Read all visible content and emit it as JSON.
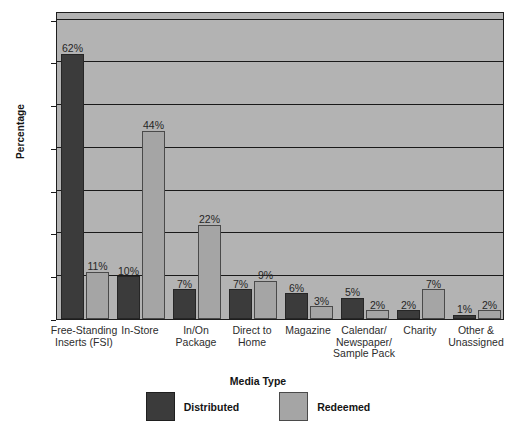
{
  "chart_data": {
    "type": "bar",
    "title": "",
    "xlabel": "Media Type",
    "ylabel": "Percentage",
    "ylim": [
      0,
      72
    ],
    "yticks": [
      0,
      10,
      20,
      30,
      40,
      50,
      60,
      70
    ],
    "ytick_labels": [
      "0",
      "10",
      "20",
      "30",
      "40",
      "50",
      "60",
      "70"
    ],
    "grid": true,
    "legend_position": "bottom",
    "value_suffix": "%",
    "categories": [
      "Free-Standing Inserts (FSI)",
      "In-Store",
      "In/On Package",
      "Direct to Home",
      "Magazine",
      "Calendar/ Newspaper/ Sample Pack",
      "Charity",
      "Other & Unassigned"
    ],
    "category_lines": [
      [
        "Free-Standing",
        "Inserts (FSI)"
      ],
      [
        "In-Store"
      ],
      [
        "In/On",
        "Package"
      ],
      [
        "Direct to",
        "Home"
      ],
      [
        "Magazine"
      ],
      [
        "Calendar/",
        "Newspaper/",
        "Sample Pack"
      ],
      [
        "Charity"
      ],
      [
        "Other &",
        "Unassigned"
      ]
    ],
    "series": [
      {
        "name": "Distributed",
        "color": "#3b3b3b",
        "values": [
          62,
          10,
          7,
          7,
          6,
          5,
          2,
          1
        ],
        "labels": [
          "62%",
          "10%",
          "7%",
          "7%",
          "6%",
          "5%",
          "2%",
          "1%"
        ]
      },
      {
        "name": "Redeemed",
        "color": "#a5a5a5",
        "values": [
          11,
          44,
          22,
          9,
          3,
          2,
          7,
          2
        ],
        "labels": [
          "11%",
          "44%",
          "22%",
          "9%",
          "3%",
          "2%",
          "7%",
          "2%"
        ]
      }
    ],
    "plot_background": "#b3b3b3",
    "axis_color": "#1a1a1a"
  },
  "legend": {
    "items": [
      {
        "label": "Distributed",
        "swatch": "distributed"
      },
      {
        "label": "Redeemed",
        "swatch": "redeemed"
      }
    ]
  },
  "caption": {
    "text": ""
  }
}
